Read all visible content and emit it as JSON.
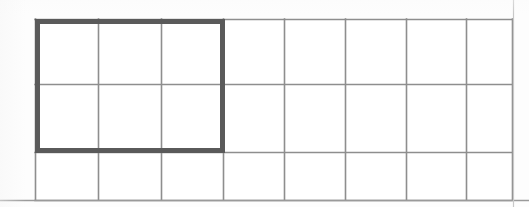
{
  "figure": {
    "title": "Rectangular grid with shaded-outline region",
    "caption": "",
    "background_color": "#fdfdfd"
  },
  "grid": {
    "columns": 8,
    "rows": 3,
    "total_cells": 24,
    "left": 35,
    "top": 19,
    "right": 512,
    "bottom": 200,
    "column_x": [
      35,
      98,
      161,
      223,
      284,
      345,
      406,
      466,
      512
    ],
    "row_y": [
      19,
      84,
      152,
      200
    ],
    "line_color": "#8e8e8e",
    "line_width": 1.6
  },
  "highlight": {
    "label": "outlined-region",
    "columns": 3,
    "rows": 2,
    "cells_covered": 6,
    "fraction_text": "6/24",
    "left": 35,
    "top": 19,
    "right": 225,
    "bottom": 153,
    "border_color": "#5a5a5a",
    "border_width": 5
  },
  "page_rules": {
    "bottom_rule": {
      "x1": 0,
      "y1": 200.5,
      "x2": 529,
      "y2": 200.5,
      "color": "#9a9a9a",
      "width": 1.4
    },
    "right_edge": {
      "x1": 513.5,
      "y1": 0,
      "x2": 513.5,
      "y2": 207,
      "color": "#c8c8c8",
      "width": 1.2
    }
  }
}
